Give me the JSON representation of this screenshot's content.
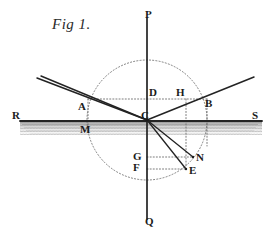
{
  "figure": {
    "caption": "Fig 1.",
    "caption_pos": {
      "x": 52,
      "y": 16
    },
    "colors": {
      "ink": "#1b1b1b",
      "ray": "#262626",
      "dotted": "#6e6e6e",
      "water_band": "#8d8d8d",
      "paper": "#ffffff"
    },
    "geometry": {
      "center": {
        "label": "C",
        "x": 147,
        "y": 120
      },
      "normal_line": {
        "top": {
          "x": 147,
          "y": 18
        },
        "bottom": {
          "x": 147,
          "y": 219
        }
      },
      "surface_line": {
        "left": {
          "x": 20,
          "y": 121
        },
        "right": {
          "x": 262,
          "y": 121
        }
      },
      "circle": {
        "cx": 147,
        "cy": 120,
        "r": 60
      },
      "chord_ADHB": {
        "y": 99,
        "x1": 88,
        "x2": 207
      },
      "water_band": {
        "x": 20,
        "y": 121,
        "w": 242,
        "h": 14
      }
    },
    "points": [
      {
        "label": "P",
        "x": 147,
        "y": 18,
        "label_x": 145,
        "label_y": 9,
        "role": "normal-upper-end"
      },
      {
        "label": "Q",
        "x": 147,
        "y": 219,
        "label_x": 145,
        "label_y": 216,
        "role": "normal-lower-end"
      },
      {
        "label": "R",
        "x": 20,
        "y": 121,
        "label_x": 12,
        "label_y": 110,
        "role": "surface-left-end"
      },
      {
        "label": "S",
        "x": 262,
        "y": 121,
        "label_x": 252,
        "label_y": 110,
        "role": "surface-right-end"
      },
      {
        "label": "A",
        "x": 88,
        "y": 99,
        "label_x": 78,
        "label_y": 101,
        "role": "incident-ray-chord-point"
      },
      {
        "label": "D",
        "x": 147,
        "y": 99,
        "label_x": 149,
        "label_y": 87,
        "role": "chord-midpoint-on-normal"
      },
      {
        "label": "H",
        "x": 186,
        "y": 99,
        "label_x": 176,
        "label_y": 87,
        "role": "chord-point-above-N"
      },
      {
        "label": "B",
        "x": 207,
        "y": 99,
        "label_x": 205,
        "label_y": 98,
        "role": "reflected-ray-chord-point"
      },
      {
        "label": "C",
        "x": 147,
        "y": 120,
        "label_x": 141,
        "label_y": 110,
        "role": "point-of-incidence"
      },
      {
        "label": "M",
        "x": 88,
        "y": 121,
        "label_x": 80,
        "label_y": 124,
        "role": "foot-below-A"
      },
      {
        "label": "G",
        "x": 147,
        "y": 157,
        "label_x": 133,
        "label_y": 151,
        "role": "normal-point-level-with-N"
      },
      {
        "label": "F",
        "x": 147,
        "y": 169,
        "label_x": 133,
        "label_y": 162,
        "role": "normal-point-level-with-E"
      },
      {
        "label": "N",
        "x": 193,
        "y": 157,
        "label_x": 196,
        "label_y": 152,
        "role": "refracted-ray-endpoint-upper"
      },
      {
        "label": "E",
        "x": 186,
        "y": 169,
        "label_x": 189,
        "label_y": 165,
        "role": "refracted-ray-endpoint-lower"
      }
    ],
    "solid_lines": [
      {
        "name": "incident-ray-AC",
        "x1": 37,
        "y1": 78,
        "x2": 147,
        "y2": 120
      },
      {
        "name": "reflected-ray-CB",
        "x1": 147,
        "y1": 120,
        "x2": 254,
        "y2": 77
      },
      {
        "name": "reflected-ray-left-branch",
        "x1": 147,
        "y1": 120,
        "x2": 41,
        "y2": 76
      },
      {
        "name": "refracted-ray-CN",
        "x1": 147,
        "y1": 120,
        "x2": 193,
        "y2": 157
      },
      {
        "name": "refracted-ray-CE",
        "x1": 147,
        "y1": 120,
        "x2": 186,
        "y2": 169
      },
      {
        "name": "normal-PQ",
        "x1": 147,
        "y1": 18,
        "x2": 147,
        "y2": 219
      },
      {
        "name": "surface-RS",
        "x1": 20,
        "y1": 121,
        "x2": 262,
        "y2": 121
      }
    ],
    "dotted_lines": [
      {
        "name": "chord-AB",
        "x1": 88,
        "y1": 99,
        "x2": 207,
        "y2": 99
      },
      {
        "name": "drop-A-to-M",
        "x1": 88,
        "y1": 99,
        "x2": 88,
        "y2": 132
      },
      {
        "name": "drop-H-to-N",
        "x1": 186,
        "y1": 99,
        "x2": 186,
        "y2": 166
      },
      {
        "name": "drop-B-to-surface",
        "x1": 207,
        "y1": 99,
        "x2": 207,
        "y2": 145
      },
      {
        "name": "level-G-to-N",
        "x1": 147,
        "y1": 157,
        "x2": 193,
        "y2": 157
      },
      {
        "name": "level-F-to-E",
        "x1": 147,
        "y1": 169,
        "x2": 186,
        "y2": 169
      }
    ],
    "labels_list": [
      "P",
      "Q",
      "R",
      "S",
      "A",
      "B",
      "C",
      "D",
      "E",
      "F",
      "G",
      "H",
      "M",
      "N"
    ]
  }
}
